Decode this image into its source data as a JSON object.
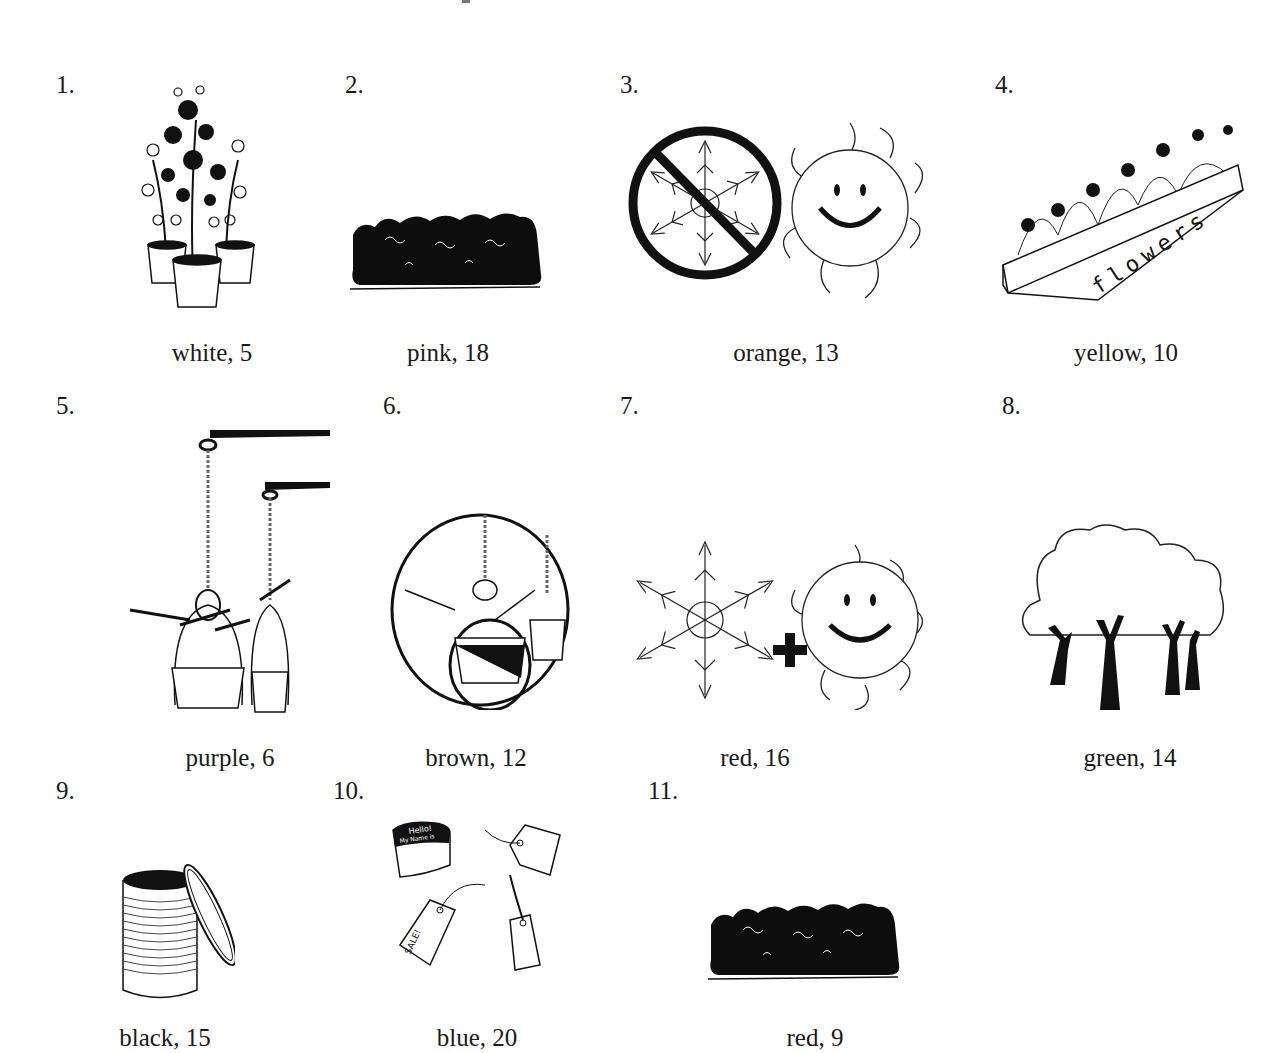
{
  "worksheet": {
    "items": [
      {
        "number": "1.",
        "caption": "white, 5",
        "picture": "potted-flowering-plants"
      },
      {
        "number": "2.",
        "caption": "pink, 18",
        "picture": "hedge-shrub"
      },
      {
        "number": "3.",
        "caption": "orange, 13",
        "picture": "no-snow-sun"
      },
      {
        "number": "4.",
        "caption": "yellow, 10",
        "picture": "flower-flat-box"
      },
      {
        "number": "5.",
        "caption": "purple, 6",
        "picture": "hanging-baskets"
      },
      {
        "number": "6.",
        "caption": "brown, 12",
        "picture": "hanging-baskets-circled"
      },
      {
        "number": "7.",
        "caption": "red, 16",
        "picture": "snow-plus-sun"
      },
      {
        "number": "8.",
        "caption": "green, 14",
        "picture": "trees"
      },
      {
        "number": "9.",
        "caption": "black, 15",
        "picture": "open-tin-can"
      },
      {
        "number": "10.",
        "caption": "blue, 20",
        "picture": "tags-and-labels"
      },
      {
        "number": "11.",
        "caption": "red, 9",
        "picture": "hedge-shrub"
      }
    ],
    "box_label": "flowers",
    "tag_texts": [
      "Hello!",
      "My Name is",
      "SALE!"
    ]
  }
}
